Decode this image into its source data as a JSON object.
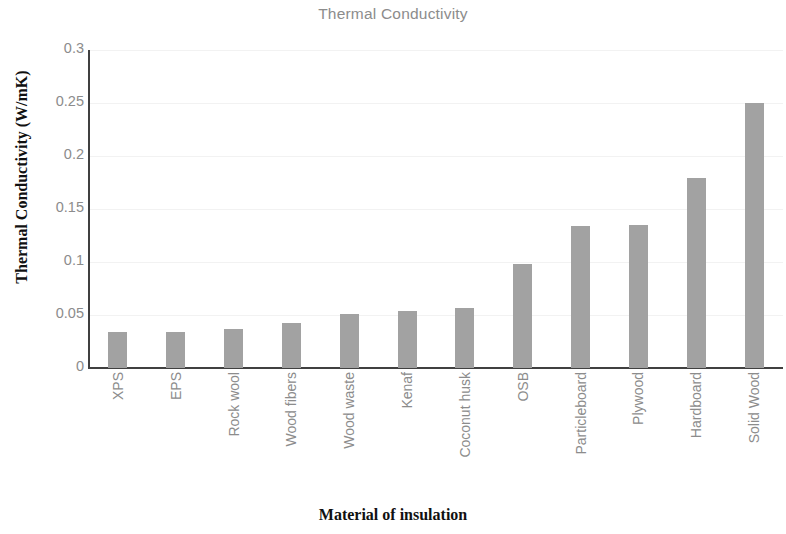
{
  "chart_data": {
    "type": "bar",
    "title": "Thermal Conductivity",
    "xlabel": "Material of insulation",
    "ylabel": "Thermal Conductivity (W/mK)",
    "categories": [
      "XPS",
      "EPS",
      "Rock wool",
      "Wood fibers",
      "Wood waste",
      "Kenaf",
      "Coconut husk",
      "OSB",
      "Particleboard",
      "Plywood",
      "Hardboard",
      "Solid Wood"
    ],
    "values": [
      0.034,
      0.034,
      0.037,
      0.042,
      0.051,
      0.054,
      0.057,
      0.098,
      0.134,
      0.135,
      0.179,
      0.25
    ],
    "ylim": [
      0,
      0.3
    ],
    "ytick_labels": [
      "0",
      "0.05",
      "0.1",
      "0.15",
      "0.2",
      "0.25",
      "0.3"
    ],
    "ytick_values": [
      0,
      0.05,
      0.1,
      0.15,
      0.2,
      0.25,
      0.3
    ],
    "grid": true,
    "legend": false,
    "bar_color": "#a2a2a2",
    "gridline_color": "#f2f2f2",
    "axis_color": "#404040",
    "title_color": "#8c8c8c",
    "tick_label_color": "#8c8c8c",
    "axis_title_color": "#111111"
  }
}
